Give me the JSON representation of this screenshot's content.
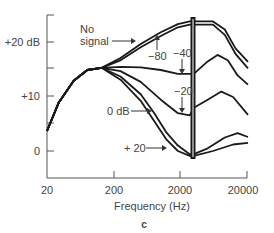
{
  "chart_data": {
    "type": "line",
    "title": "",
    "panel_label": "c",
    "xlabel": "Frequency (Hz)",
    "ylabel": "",
    "x_scale": "log",
    "xlim": [
      20,
      20000
    ],
    "ylim": [
      -4.5,
      25
    ],
    "x_ticks": [
      20,
      200,
      2000,
      20000
    ],
    "x_tick_labels": [
      "20",
      "200",
      "2000",
      "20000"
    ],
    "y_ticks": [
      0,
      5,
      10,
      15,
      20
    ],
    "y_tick_labels": [
      "0",
      "",
      "+10",
      "",
      "+20 dB"
    ],
    "grid": false,
    "legend": "inline annotations",
    "notch_frequency_hz": 2900,
    "series": [
      {
        "name": "No signal",
        "points": [
          [
            20,
            3.7
          ],
          [
            30,
            9
          ],
          [
            50,
            13
          ],
          [
            80,
            15
          ],
          [
            130,
            15.4
          ],
          [
            250,
            17.2
          ],
          [
            500,
            19.8
          ],
          [
            1000,
            22
          ],
          [
            1800,
            23.5
          ],
          [
            2700,
            24
          ],
          [
            3100,
            24
          ],
          [
            6000,
            24
          ],
          [
            9000,
            22.5
          ],
          [
            13000,
            19
          ],
          [
            20000,
            16.5
          ]
        ]
      },
      {
        "name": "-80",
        "points": [
          [
            20,
            3.7
          ],
          [
            30,
            9
          ],
          [
            50,
            13
          ],
          [
            80,
            15
          ],
          [
            130,
            15.4
          ],
          [
            250,
            16.8
          ],
          [
            500,
            19.2
          ],
          [
            1000,
            21.3
          ],
          [
            1800,
            22.9
          ],
          [
            2700,
            23.4
          ],
          [
            3100,
            23.4
          ],
          [
            6000,
            23.4
          ],
          [
            9000,
            21.5
          ],
          [
            13000,
            18
          ],
          [
            20000,
            15.3
          ]
        ]
      },
      {
        "name": "-40",
        "points": [
          [
            20,
            3.7
          ],
          [
            30,
            9
          ],
          [
            50,
            13
          ],
          [
            80,
            15
          ],
          [
            130,
            15.4
          ],
          [
            250,
            15.6
          ],
          [
            500,
            15.5
          ],
          [
            1000,
            15
          ],
          [
            1800,
            14.3
          ],
          [
            2700,
            14.3
          ],
          [
            3100,
            14.3
          ],
          [
            5000,
            16.6
          ],
          [
            7000,
            17.8
          ],
          [
            10000,
            16.8
          ],
          [
            14000,
            14
          ],
          [
            20000,
            12.3
          ]
        ]
      },
      {
        "name": "-20",
        "points": [
          [
            20,
            3.7
          ],
          [
            30,
            9
          ],
          [
            50,
            13
          ],
          [
            80,
            15
          ],
          [
            130,
            15.4
          ],
          [
            250,
            14.8
          ],
          [
            500,
            12.8
          ],
          [
            1000,
            9.5
          ],
          [
            1800,
            7
          ],
          [
            2700,
            6.6
          ],
          [
            3100,
            8
          ],
          [
            5000,
            9.5
          ],
          [
            8000,
            11
          ],
          [
            12000,
            10
          ],
          [
            20000,
            6.7
          ]
        ]
      },
      {
        "name": "0 dB",
        "points": [
          [
            20,
            3.7
          ],
          [
            30,
            9
          ],
          [
            50,
            13
          ],
          [
            80,
            15
          ],
          [
            130,
            15.4
          ],
          [
            250,
            13.8
          ],
          [
            500,
            10.5
          ],
          [
            800,
            7
          ],
          [
            1200,
            3.5
          ],
          [
            1800,
            1
          ],
          [
            2700,
            -0.6
          ],
          [
            3100,
            -0.6
          ],
          [
            5000,
            0.5
          ],
          [
            9000,
            2.5
          ],
          [
            14000,
            3.3
          ],
          [
            20000,
            2.6
          ]
        ]
      },
      {
        "name": "+ 20",
        "points": [
          [
            20,
            3.7
          ],
          [
            30,
            9
          ],
          [
            50,
            13
          ],
          [
            80,
            15
          ],
          [
            130,
            15.4
          ],
          [
            250,
            13.2
          ],
          [
            500,
            9.3
          ],
          [
            800,
            5.5
          ],
          [
            1200,
            2.2
          ],
          [
            1800,
            0
          ],
          [
            2700,
            -0.9
          ],
          [
            3100,
            -0.9
          ],
          [
            6000,
            0
          ],
          [
            12000,
            1.2
          ],
          [
            20000,
            1.5
          ]
        ]
      }
    ],
    "annotations": [
      {
        "text": "No signal",
        "arrow_to_series": "No signal"
      },
      {
        "text": "-80",
        "arrow_to_series": "-80"
      },
      {
        "text": "-40",
        "arrow_to_series": "-40"
      },
      {
        "text": "-20",
        "arrow_to_series": "-20"
      },
      {
        "text": "0 dB",
        "arrow_to_series": "0 dB"
      },
      {
        "text": "+ 20",
        "arrow_to_series": "+ 20"
      }
    ]
  },
  "labels": {
    "no_signal_line1": "No",
    "no_signal_line2": "signal",
    "m80": "−80",
    "m40": "−40",
    "m20": "−20",
    "zero_db": "0 dB",
    "plus20": "+ 20",
    "y_20": "+20 dB",
    "y_10": "+10",
    "y_0": "0",
    "x_20": "20",
    "x_200": "200",
    "x_2000": "2000",
    "x_20000": "20000",
    "xlabel": "Frequency (Hz)",
    "panel": "c"
  }
}
